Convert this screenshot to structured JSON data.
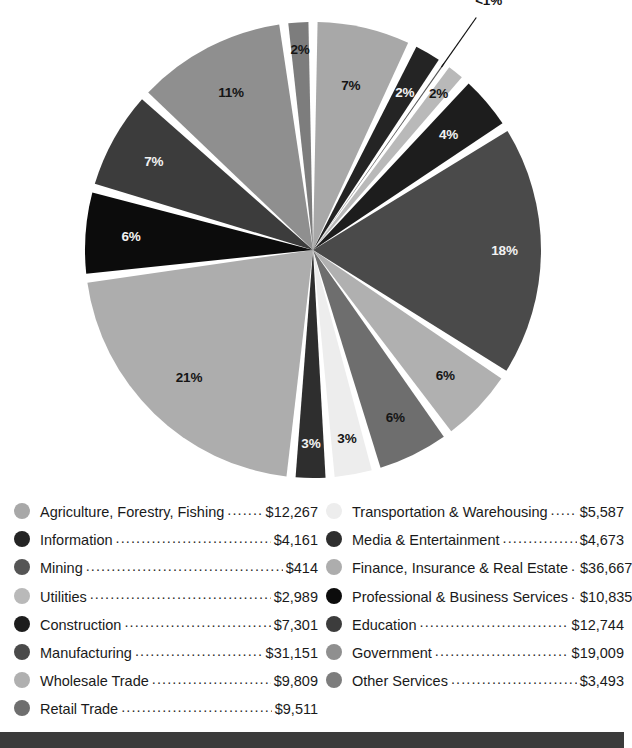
{
  "chart_data": {
    "type": "pie",
    "title": "",
    "subtitle": "",
    "xlabel": "",
    "ylabel": "",
    "legend_position": "bottom",
    "grid": false,
    "value_prefix": "$",
    "start_angle_deg": 0,
    "direction": "clockwise",
    "categories": [
      "Agriculture, Forestry, Fishing",
      "Information",
      "Mining",
      "Utilities",
      "Construction",
      "Manufacturing",
      "Wholesale Trade",
      "Retail Trade",
      "Transportation & Warehousing",
      "Media & Entertainment",
      "Finance, Insurance & Real Estate",
      "Professional & Business Services",
      "Education",
      "Government",
      "Other Services"
    ],
    "values": [
      12267,
      4161,
      414,
      2989,
      7301,
      31151,
      9809,
      9511,
      5587,
      4673,
      36667,
      10835,
      12744,
      19009,
      3493
    ],
    "value_labels": [
      "$12,267",
      "$4,161",
      "$414",
      "$2,989",
      "$7,301",
      "$31,151",
      "$9,809",
      "$9,511",
      "$5,587",
      "$4,673",
      "$36,667",
      "$10,835",
      "$12,744",
      "$19,009",
      "$3,493"
    ],
    "percent_labels": [
      "7%",
      "2%",
      "<1%",
      "2%",
      "4%",
      "18%",
      "6%",
      "6%",
      "3%",
      "3%",
      "21%",
      "6%",
      "7%",
      "11%",
      "2%"
    ],
    "percents": [
      7.0,
      2.4,
      0.2,
      1.7,
      4.2,
      17.8,
      5.6,
      5.4,
      3.2,
      2.7,
      21.0,
      6.2,
      7.3,
      10.9,
      2.0
    ],
    "colors": [
      "#a8a8a8",
      "#242424",
      "#555555",
      "#b9b9b9",
      "#1d1d1d",
      "#4a4a4a",
      "#b0b0b0",
      "#6e6e6e",
      "#ededed",
      "#2e2e2e",
      "#adadad",
      "#0c0c0c",
      "#3c3c3c",
      "#8f8f8f",
      "#7d7d7d"
    ]
  },
  "pie": {
    "slices": [
      {
        "name": "Agriculture, Forestry, Fishing",
        "percent_label": "7%",
        "sweep": 25.2,
        "color": "#a8a8a8",
        "label_tone": "dark",
        "label_r": 0.74,
        "callout": false
      },
      {
        "name": "Information",
        "percent_label": "2%",
        "sweep": 8.6,
        "color": "#242424",
        "label_tone": "light",
        "label_r": 0.8,
        "callout": false
      },
      {
        "name": "Mining",
        "percent_label": "<1%",
        "sweep": 0.9,
        "color": "#555555",
        "label_tone": "dark",
        "label_r": 1.34,
        "callout": true
      },
      {
        "name": "Utilities",
        "percent_label": "2%",
        "sweep": 6.2,
        "color": "#b9b9b9",
        "label_tone": "dark",
        "label_r": 0.88,
        "callout": false
      },
      {
        "name": "Construction",
        "percent_label": "4%",
        "sweep": 15.1,
        "color": "#1d1d1d",
        "label_tone": "light",
        "label_r": 0.78,
        "callout": false
      },
      {
        "name": "Manufacturing",
        "percent_label": "18%",
        "sweep": 64.2,
        "color": "#4a4a4a",
        "label_tone": "light",
        "label_r": 0.84,
        "callout": false
      },
      {
        "name": "Wholesale Trade",
        "percent_label": "6%",
        "sweep": 20.2,
        "color": "#b0b0b0",
        "label_tone": "dark",
        "label_r": 0.8,
        "callout": false
      },
      {
        "name": "Retail Trade",
        "percent_label": "6%",
        "sweep": 19.6,
        "color": "#6e6e6e",
        "label_tone": "dark",
        "label_r": 0.82,
        "callout": false
      },
      {
        "name": "Transportation & Warehousing",
        "percent_label": "3%",
        "sweep": 11.5,
        "color": "#ededed",
        "label_tone": "dark",
        "label_r": 0.84,
        "callout": false
      },
      {
        "name": "Media & Entertainment",
        "percent_label": "3%",
        "sweep": 9.6,
        "color": "#2e2e2e",
        "label_tone": "light",
        "label_r": 0.85,
        "callout": false
      },
      {
        "name": "Finance, Insurance & Real Estate",
        "percent_label": "21%",
        "sweep": 75.5,
        "color": "#adadad",
        "label_tone": "dark",
        "label_r": 0.78,
        "callout": false
      },
      {
        "name": "Professional & Business Services",
        "percent_label": "6%",
        "sweep": 22.3,
        "color": "#0c0c0c",
        "label_tone": "light",
        "label_r": 0.8,
        "callout": false
      },
      {
        "name": "Education",
        "percent_label": "7%",
        "sweep": 26.2,
        "color": "#3c3c3c",
        "label_tone": "light",
        "label_r": 0.8,
        "callout": false
      },
      {
        "name": "Government",
        "percent_label": "11%",
        "sweep": 39.1,
        "color": "#8f8f8f",
        "label_tone": "dark",
        "label_r": 0.78,
        "callout": false
      },
      {
        "name": "Other Services",
        "percent_label": "2%",
        "sweep": 7.2,
        "color": "#7d7d7d",
        "label_tone": "dark",
        "label_r": 0.88,
        "callout": false
      }
    ]
  },
  "legend": {
    "left_column": [
      {
        "label": "Agriculture, Forestry, Fishing",
        "value": "$12,267",
        "color": "#a8a8a8"
      },
      {
        "label": "Information",
        "value": "$4,161",
        "color": "#242424"
      },
      {
        "label": "Mining",
        "value": "$414",
        "color": "#555555"
      },
      {
        "label": "Utilities",
        "value": "$2,989",
        "color": "#b9b9b9"
      },
      {
        "label": "Construction",
        "value": "$7,301",
        "color": "#1d1d1d"
      },
      {
        "label": "Manufacturing",
        "value": "$31,151",
        "color": "#4a4a4a"
      },
      {
        "label": "Wholesale Trade",
        "value": "$9,809",
        "color": "#b0b0b0"
      },
      {
        "label": "Retail Trade",
        "value": "$9,511",
        "color": "#6e6e6e"
      }
    ],
    "right_column": [
      {
        "label": "Transportation & Warehousing",
        "value": "$5,587",
        "color": "#ededed"
      },
      {
        "label": "Media & Entertainment",
        "value": "$4,673",
        "color": "#2e2e2e"
      },
      {
        "label": "Finance, Insurance & Real Estate",
        "value": "$36,667",
        "color": "#adadad"
      },
      {
        "label": "Professional & Business Services",
        "value": "$10,835",
        "color": "#0c0c0c"
      },
      {
        "label": "Education",
        "value": "$12,744",
        "color": "#3c3c3c"
      },
      {
        "label": "Government",
        "value": "$19,009",
        "color": "#8f8f8f"
      },
      {
        "label": "Other Services",
        "value": "$3,493",
        "color": "#7d7d7d"
      }
    ]
  },
  "footer": {
    "bar_color": "#3b3b3b"
  }
}
